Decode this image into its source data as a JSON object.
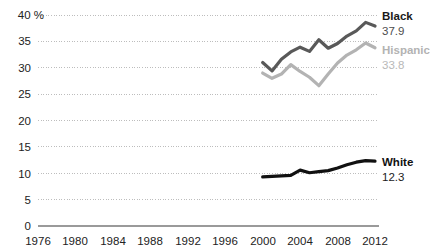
{
  "chart_data": {
    "type": "line",
    "title": "",
    "subtitle": "",
    "xlabel": "",
    "ylabel": "%",
    "unit_label": "40 %",
    "xlim": [
      1976,
      2013
    ],
    "ylim": [
      0,
      40
    ],
    "grid": true,
    "legend": "inline-right-end-labels",
    "y_ticks": [
      "40 %",
      "35",
      "30",
      "25",
      "20",
      "15",
      "10",
      "5",
      "0"
    ],
    "y_tick_values": [
      40,
      35,
      30,
      25,
      20,
      15,
      10,
      5,
      0
    ],
    "x_ticks": [
      "1976",
      "1980",
      "1984",
      "1988",
      "1992",
      "1996",
      "2000",
      "2004",
      "2008",
      "2012"
    ],
    "x_tick_values": [
      1976,
      1980,
      1984,
      1988,
      1992,
      1996,
      2000,
      2004,
      2008,
      2012
    ],
    "x": [
      2000,
      2001,
      2002,
      2003,
      2004,
      2005,
      2006,
      2007,
      2008,
      2009,
      2010,
      2011,
      2012
    ],
    "series": [
      {
        "name": "Black",
        "end_label": "Black",
        "end_value": "37.9",
        "color": "#595959",
        "values": [
          31.0,
          29.4,
          31.6,
          33.0,
          33.9,
          33.1,
          35.3,
          33.7,
          34.6,
          36.0,
          37.0,
          38.6,
          37.9
        ]
      },
      {
        "name": "Hispanic",
        "end_label": "Hispanic",
        "end_value": "33.8",
        "color": "#b3b3b3",
        "values": [
          29.0,
          28.0,
          28.8,
          30.6,
          29.3,
          28.2,
          26.6,
          28.8,
          30.9,
          32.4,
          33.4,
          34.7,
          33.8
        ]
      },
      {
        "name": "White",
        "end_label": "White",
        "end_value": "12.3",
        "color": "#111111",
        "values": [
          9.3,
          9.4,
          9.5,
          9.6,
          10.6,
          10.1,
          10.3,
          10.5,
          11.0,
          11.6,
          12.1,
          12.4,
          12.3
        ]
      }
    ],
    "colors": {
      "black_series": "#595959",
      "hispanic_series": "#b3b3b3",
      "white_series": "#111111",
      "grid": "#bdbdbd",
      "axis": "#9a9a9a",
      "text": "#222222",
      "muted_text": "#b3b3b3"
    }
  }
}
